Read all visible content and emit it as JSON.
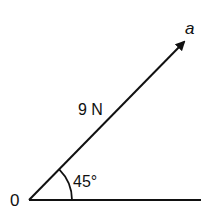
{
  "diagram": {
    "type": "vector-diagram",
    "colors": {
      "stroke": "#111111",
      "background": "#ffffff"
    },
    "origin": {
      "label": "0",
      "x": 29,
      "y": 200
    },
    "baseline": {
      "x1": 29,
      "y1": 200,
      "x2": 201,
      "y2": 200
    },
    "vector": {
      "label": "a",
      "magnitude_label": "9 N",
      "x1": 29,
      "y1": 200,
      "x2": 184,
      "y2": 42
    },
    "angle": {
      "label": "45°",
      "value_degrees": 45,
      "arc_radius": 43
    }
  }
}
